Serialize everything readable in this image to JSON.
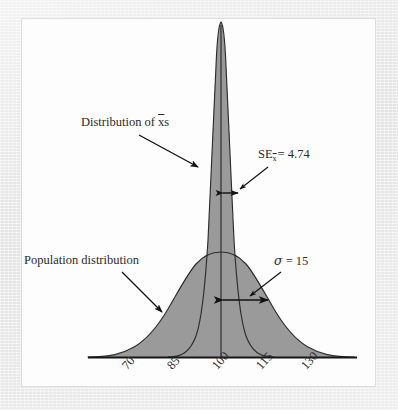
{
  "figure": {
    "background_color": "#e9e9e9",
    "panel_color": "#fdfdfd",
    "curve_fill_color": "#9a9a9a",
    "curve_stroke_color": "#333333",
    "axis_color": "#1a1a1a"
  },
  "annotations": {
    "distribution_of_xbars": {
      "prefix": "Distribution of ",
      "symbol": "x",
      "suffix": "s",
      "full_text": "Distribution of x̄s"
    },
    "population_distribution": {
      "full_text": "Population distribution"
    },
    "standard_error": {
      "name": "SE",
      "subscript": "x",
      "equals": "= 4.74",
      "value": "4.74",
      "full_text": "SE x̄ = 4.74"
    },
    "population_sigma": {
      "symbol": "σ",
      "equals": "= 15",
      "value": "15",
      "full_text": "σ = 15"
    }
  },
  "chart_data": {
    "type": "line",
    "title": "",
    "subtitle": "",
    "xlabel": "",
    "ylabel": "",
    "grid": false,
    "legend_position": "annotations-inline",
    "xlim": [
      55,
      145
    ],
    "ylim": [
      0,
      1
    ],
    "tick_labels": [
      "70",
      "85",
      "100",
      "115",
      "130"
    ],
    "tick_values": [
      70,
      85,
      100,
      115,
      130
    ],
    "tick_rotation_deg": -48,
    "center": 100,
    "series": [
      {
        "name": "Population distribution",
        "mean": 100,
        "sd": 15,
        "sd_label": "σ = 15",
        "peak_height_rel": 0.3,
        "shaded": true,
        "marker_arrow": {
          "from": 100,
          "to": 115,
          "double_headed": true
        }
      },
      {
        "name": "Distribution of x̄s",
        "mean": 100,
        "sd": 4.74,
        "sd_label": "SE = 4.74",
        "peak_height_rel": 1.0,
        "shaded": true,
        "marker_arrow": {
          "from": 100,
          "to": 104.74,
          "double_headed": true
        }
      }
    ]
  }
}
